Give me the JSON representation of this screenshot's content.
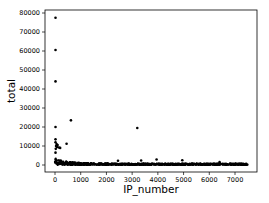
{
  "chart_data": {
    "type": "scatter",
    "title": "",
    "xlabel": "IP_number",
    "ylabel": "total",
    "xlim": [
      -400,
      7900
    ],
    "ylim": [
      -4000,
      81000
    ],
    "xticks": [
      0,
      1000,
      2000,
      3000,
      4000,
      5000,
      6000,
      7000
    ],
    "yticks": [
      0,
      10000,
      20000,
      30000,
      40000,
      50000,
      60000,
      70000,
      80000
    ],
    "xtick_labels": [
      "0",
      "1000",
      "2000",
      "3000",
      "4000",
      "5000",
      "6000",
      "7000"
    ],
    "ytick_labels": [
      "0",
      "10000",
      "20000",
      "30000",
      "40000",
      "50000",
      "60000",
      "70000",
      "80000"
    ],
    "grid": false,
    "legend": null,
    "marker_color": "#000000",
    "dense_band": {
      "x_range": [
        0,
        7500
      ],
      "y_range": [
        0,
        1000
      ],
      "description": "dense cluster of points near zero across all IP numbers, taller near x=0 (up to ~3000)"
    },
    "points": [
      {
        "x": 20,
        "y": 77500
      },
      {
        "x": 20,
        "y": 60500
      },
      {
        "x": 20,
        "y": 44000
      },
      {
        "x": 20,
        "y": 20000
      },
      {
        "x": 620,
        "y": 23500
      },
      {
        "x": 3200,
        "y": 19500
      },
      {
        "x": 20,
        "y": 13500
      },
      {
        "x": 20,
        "y": 12000
      },
      {
        "x": 60,
        "y": 11000
      },
      {
        "x": 100,
        "y": 10500
      },
      {
        "x": 40,
        "y": 10000
      },
      {
        "x": 80,
        "y": 9500
      },
      {
        "x": 150,
        "y": 9200
      },
      {
        "x": 200,
        "y": 9000
      },
      {
        "x": 30,
        "y": 8500
      },
      {
        "x": 20,
        "y": 6500
      },
      {
        "x": 450,
        "y": 11200
      },
      {
        "x": 2450,
        "y": 2200
      },
      {
        "x": 3350,
        "y": 2400
      },
      {
        "x": 3950,
        "y": 2900
      },
      {
        "x": 4950,
        "y": 2500
      },
      {
        "x": 6400,
        "y": 1500
      }
    ]
  }
}
